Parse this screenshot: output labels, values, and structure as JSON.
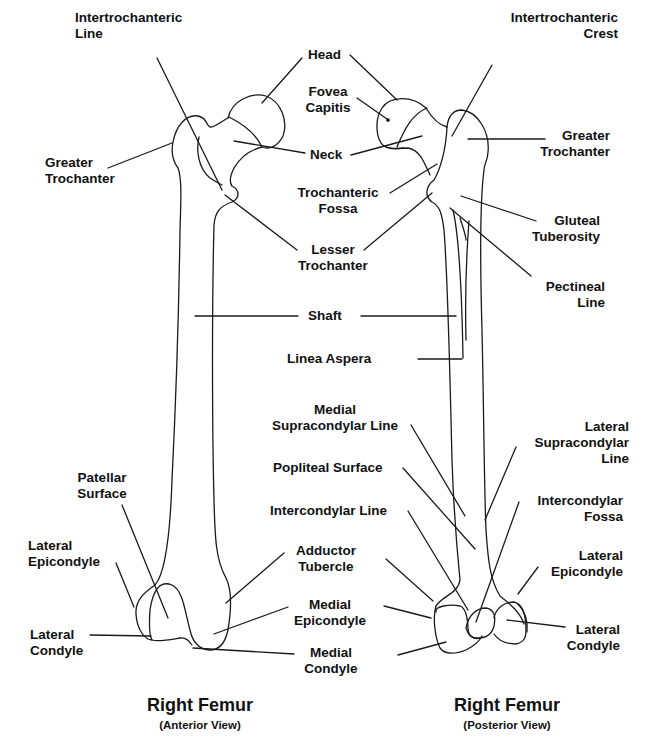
{
  "diagram": {
    "stroke_color": "#1a1a1a",
    "background": "#ffffff"
  },
  "anterior": {
    "title": "Right Femur",
    "subtitle": "(Anterior View)",
    "labels": {
      "intertrochanteric_line": "Intertrochanteric\nLine",
      "greater_trochanter": "Greater\nTrochanter",
      "patellar_surface": "Patellar\nSurface",
      "lateral_epicondyle": "Lateral\nEpicondyle",
      "lateral_condyle": "Lateral\nCondyle"
    }
  },
  "shared": {
    "labels": {
      "head": "Head",
      "fovea_capitis": "Fovea\nCapitis",
      "neck": "Neck",
      "trochanteric_fossa": "Trochanteric\nFossa",
      "lesser_trochanter": "Lesser\nTrochanter",
      "shaft": "Shaft",
      "linea_aspera": "Linea Aspera",
      "medial_supracondylar_line": "Medial\nSupracondylar Line",
      "popliteal_surface": "Popliteal Surface",
      "intercondylar_line": "Intercondylar Line",
      "adductor_tubercle": "Adductor\nTubercle",
      "medial_epicondyle": "Medial\nEpicondyle",
      "medial_condyle": "Medial\nCondyle"
    }
  },
  "posterior": {
    "title": "Right Femur",
    "subtitle": "(Posterior View)",
    "labels": {
      "intertrochanteric_crest": "Intertrochanteric\nCrest",
      "greater_trochanter": "Greater\nTrochanter",
      "gluteal_tuberosity": "Gluteal\nTuberosity",
      "pectineal_line": "Pectineal\nLine",
      "lateral_supracondylar_line": "Lateral\nSupracondylar\nLine",
      "intercondylar_fossa": "Intercondylar\nFossa",
      "lateral_epicondyle": "Lateral\nEpicondyle",
      "lateral_condyle": "Lateral\nCondyle"
    }
  }
}
